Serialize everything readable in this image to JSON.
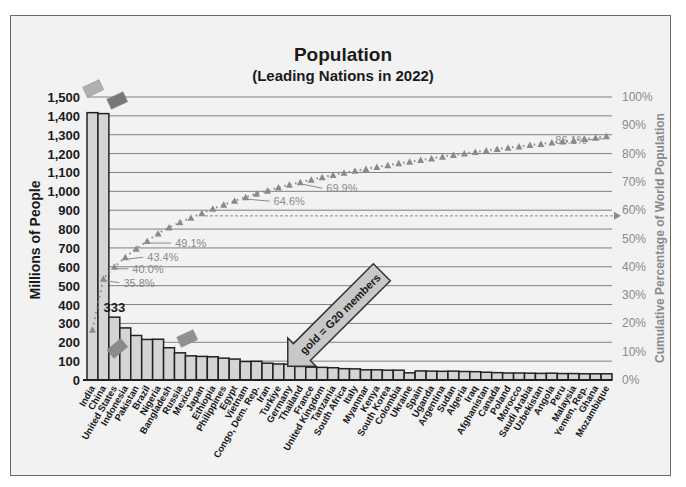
{
  "chart": {
    "title": "Population",
    "subtitle": "(Leading Nations in 2022)",
    "ylabel": "Millions of People",
    "y2label": "Cumulative Percentage of World Population",
    "annotation_arrow": "gold  = G20 members",
    "bar_value_label": "333"
  },
  "chart_data": {
    "type": "bar",
    "xlabel": "",
    "ylabel": "Millions of People",
    "y2label": "Cumulative Percentage of World Population",
    "ylim": [
      0,
      1500
    ],
    "y2lim": [
      0,
      100
    ],
    "yticks": [
      "0",
      "100",
      "200",
      "300",
      "400",
      "500",
      "600",
      "700",
      "800",
      "900",
      "1,000",
      "1,100",
      "1,200",
      "1,300",
      "1,400",
      "1,500"
    ],
    "y2ticks": [
      "0%",
      "10%",
      "20%",
      "30%",
      "40%",
      "50%",
      "60%",
      "70%",
      "80%",
      "90%",
      "100%"
    ],
    "grid": true,
    "categories": [
      "India",
      "China",
      "United States",
      "Indonesia",
      "Pakistan",
      "Brazil",
      "Nigeria",
      "Bangladesh",
      "Russia",
      "Mexico",
      "Japan",
      "Ethiopia",
      "Philippines",
      "Egypt",
      "Vietnam",
      "Congo, Dem. Rep.",
      "Iran",
      "Turkiye",
      "Germany",
      "Thailand",
      "France",
      "United Kingdom",
      "Tanzania",
      "South Africa",
      "Italy",
      "Myanmar",
      "Kenya",
      "South Korea",
      "Colombia",
      "Ukraine",
      "Spain",
      "Uganda",
      "Argentina",
      "Sudan",
      "Algeria",
      "Iraq",
      "Afghanistan",
      "Canada",
      "Poland",
      "Morocco",
      "Saudi Arabia",
      "Uzbekistan",
      "Angola",
      "Peru",
      "Malaysia",
      "Yemen, Rep.",
      "Ghana",
      "Mozambique"
    ],
    "series": [
      {
        "name": "Population (millions)",
        "type": "bar",
        "values": [
          1417,
          1412,
          333,
          276,
          236,
          215,
          216,
          171,
          144,
          128,
          125,
          123,
          116,
          111,
          98,
          99,
          89,
          85,
          84,
          72,
          68,
          67,
          65,
          60,
          59,
          54,
          54,
          52,
          52,
          38,
          48,
          47,
          46,
          47,
          45,
          44,
          41,
          39,
          37,
          37,
          36,
          35,
          36,
          34,
          34,
          33,
          33,
          33
        ]
      },
      {
        "name": "Cumulative % of world population",
        "type": "line",
        "values": [
          17.8,
          35.8,
          40.0,
          43.4,
          46.4,
          49.1,
          51.8,
          53.9,
          55.7,
          57.3,
          58.9,
          60.5,
          61.9,
          63.3,
          64.6,
          65.8,
          66.9,
          68.0,
          69.0,
          69.9,
          70.8,
          71.6,
          72.4,
          73.2,
          73.9,
          74.6,
          75.3,
          75.9,
          76.6,
          77.1,
          77.7,
          78.3,
          78.9,
          79.5,
          80.0,
          80.6,
          81.1,
          81.6,
          82.1,
          82.5,
          83.0,
          83.4,
          83.9,
          84.3,
          84.7,
          85.2,
          85.6,
          86.1
        ]
      }
    ],
    "data_labels": [
      {
        "index": 2,
        "series": 0,
        "text": "333"
      },
      {
        "index": 1,
        "series": 1,
        "text": "35.8%"
      },
      {
        "index": 2,
        "series": 1,
        "text": "40.0%"
      },
      {
        "index": 3,
        "series": 1,
        "text": "43.4%"
      },
      {
        "index": 5,
        "series": 1,
        "text": "49.1%"
      },
      {
        "index": 14,
        "series": 1,
        "text": "64.6%"
      },
      {
        "index": 19,
        "series": 1,
        "text": "69.9%"
      },
      {
        "index": 47,
        "series": 1,
        "text": "86.1%"
      }
    ],
    "annotations": [
      "gold  = G20 members",
      "dashed arrow at ~58% pointing right"
    ],
    "legend": "none"
  },
  "colors": {
    "bar_fill": "#d4d4d4",
    "bar_stroke": "#222222",
    "grid": "#808080",
    "cumulative": "#8a8a8a",
    "frame_bg": "#f2f2f2"
  }
}
